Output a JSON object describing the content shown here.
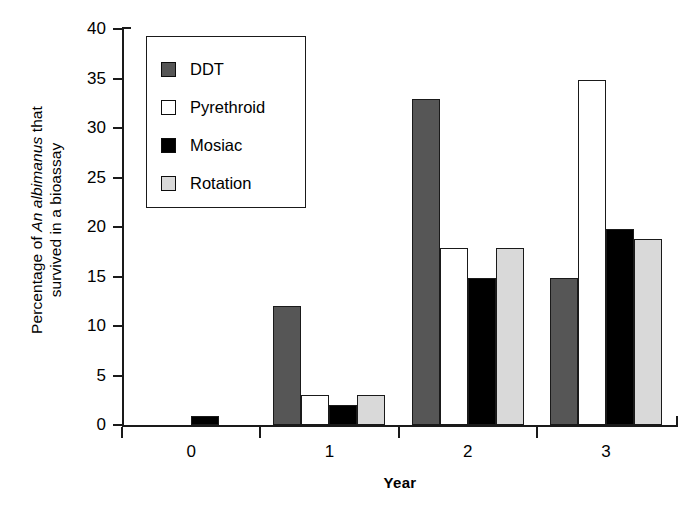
{
  "chart_data": {
    "type": "bar",
    "title": "",
    "subtitle": "",
    "xlabel": "Year",
    "ylabel": "Percentage of An albimanus that survived in a bioassay",
    "ylabel_lines": [
      "Percentage of An albimanus that",
      "survived in a bioassay"
    ],
    "ylabel_italic_part": "An albimanus",
    "categories": [
      "0",
      "1",
      "2",
      "3"
    ],
    "series": [
      {
        "name": "DDT",
        "color": "#565656",
        "values": [
          0,
          12,
          32.9,
          14.9
        ]
      },
      {
        "name": "Pyrethroid",
        "color": "#ffffff",
        "values": [
          0,
          3,
          17.9,
          34.9
        ]
      },
      {
        "name": "Mosiac",
        "color": "#000000",
        "values": [
          0.9,
          2,
          14.9,
          19.8
        ]
      },
      {
        "name": "Rotation",
        "color": "#d9d9d9",
        "values": [
          0,
          3,
          17.9,
          18.8
        ]
      }
    ],
    "ylim": [
      0,
      40
    ],
    "yticks": [
      0,
      5,
      10,
      15,
      20,
      25,
      30,
      35,
      40
    ],
    "ytick_labels": [
      "0",
      "5",
      "10",
      "15",
      "20",
      "25",
      "30",
      "35",
      "40"
    ],
    "xtick_labels": [
      "0",
      "1",
      "2",
      "3"
    ],
    "grid": false,
    "legend_position": "upper-left-inside",
    "legend_entries": [
      {
        "label": "DDT",
        "swatch": "#565656"
      },
      {
        "label": "Pyrethroid",
        "swatch": "#ffffff"
      },
      {
        "label": "Mosiac",
        "swatch": "#000000"
      },
      {
        "label": "Rotation",
        "swatch": "#d9d9d9"
      }
    ]
  }
}
